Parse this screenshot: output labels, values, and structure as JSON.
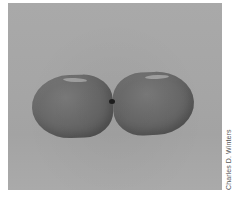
{
  "image": {
    "description": "Two dark gray balloons tied together at their knots, floating against a plain gray background",
    "background_color": "#a7a7a7",
    "balloon_color": "#666666",
    "knot_color": "#1e1e1e"
  },
  "credit": {
    "text": "Charles D. Winters"
  }
}
